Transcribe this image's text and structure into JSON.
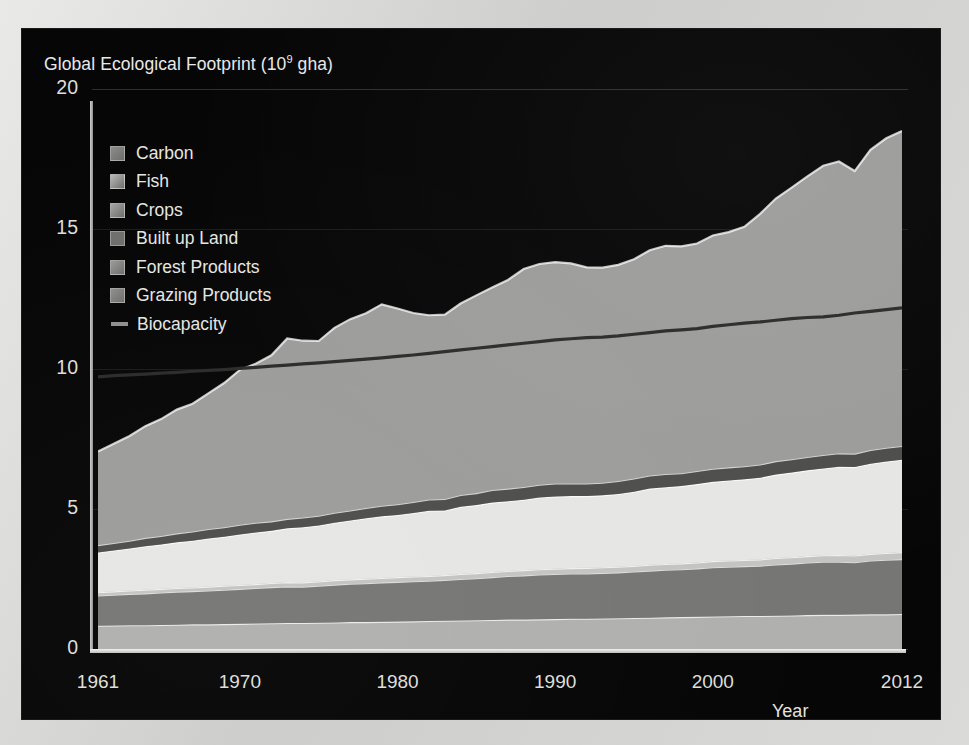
{
  "figure": {
    "title_base": "Global Ecological Footprint (10",
    "title_sup": "9",
    "title_tail": " gha)",
    "background_color": "#060606",
    "text_color": "#e6e6e2"
  },
  "axes": {
    "y_ticks": [
      "0",
      "5",
      "10",
      "15",
      "20"
    ],
    "x_ticks": [
      "1961",
      "1970",
      "1980",
      "1990",
      "2000",
      "2012"
    ],
    "x_title": "Year",
    "y_title": ""
  },
  "legend": {
    "items": [
      {
        "label": "Carbon",
        "color": "#8c8c8a",
        "marker": "square"
      },
      {
        "label": "Fish",
        "color": "#b9b9b7",
        "marker": "square"
      },
      {
        "label": "Crops",
        "color": "#a5a5a3",
        "marker": "square"
      },
      {
        "label": "Built up Land",
        "color": "#6f6f6d",
        "marker": "square"
      },
      {
        "label": "Forest Products",
        "color": "#9a9a98",
        "marker": "square"
      },
      {
        "label": "Grazing Products",
        "color": "#8f8f8d",
        "marker": "square"
      },
      {
        "label": "Biocapacity",
        "color": "#8f8f8d",
        "marker": "line"
      }
    ]
  },
  "chart_data": {
    "type": "area",
    "stacked": true,
    "xlabel": "Year",
    "ylabel": "Global Ecological Footprint (10⁹ gha)",
    "xlim": [
      1961,
      2012
    ],
    "ylim": [
      0,
      20
    ],
    "grid": true,
    "legend_position": "upper-left-inside",
    "x": [
      1961,
      1962,
      1963,
      1964,
      1965,
      1966,
      1967,
      1968,
      1969,
      1970,
      1971,
      1972,
      1973,
      1974,
      1975,
      1976,
      1977,
      1978,
      1979,
      1980,
      1981,
      1982,
      1983,
      1984,
      1985,
      1986,
      1987,
      1988,
      1989,
      1990,
      1991,
      1992,
      1993,
      1994,
      1995,
      1996,
      1997,
      1998,
      1999,
      2000,
      2001,
      2002,
      2003,
      2004,
      2005,
      2006,
      2007,
      2008,
      2009,
      2010,
      2011,
      2012
    ],
    "series": [
      {
        "name": "Grazing Products",
        "color": "#b0b0ae",
        "stack_order": 1,
        "values": [
          0.83,
          0.84,
          0.85,
          0.85,
          0.86,
          0.87,
          0.88,
          0.88,
          0.89,
          0.9,
          0.91,
          0.92,
          0.93,
          0.93,
          0.94,
          0.95,
          0.96,
          0.96,
          0.97,
          0.98,
          0.99,
          1.0,
          1.01,
          1.02,
          1.03,
          1.04,
          1.05,
          1.05,
          1.06,
          1.07,
          1.08,
          1.08,
          1.09,
          1.1,
          1.11,
          1.12,
          1.13,
          1.14,
          1.15,
          1.16,
          1.17,
          1.18,
          1.18,
          1.19,
          1.2,
          1.21,
          1.22,
          1.22,
          1.23,
          1.24,
          1.24,
          1.25
        ]
      },
      {
        "name": "Forest Products",
        "color": "#767674",
        "stack_order": 2,
        "values": [
          1.08,
          1.1,
          1.12,
          1.14,
          1.16,
          1.18,
          1.19,
          1.21,
          1.23,
          1.25,
          1.27,
          1.29,
          1.31,
          1.3,
          1.32,
          1.35,
          1.37,
          1.39,
          1.41,
          1.42,
          1.43,
          1.44,
          1.46,
          1.48,
          1.5,
          1.53,
          1.56,
          1.58,
          1.6,
          1.61,
          1.62,
          1.62,
          1.63,
          1.64,
          1.66,
          1.68,
          1.7,
          1.71,
          1.73,
          1.76,
          1.77,
          1.78,
          1.8,
          1.83,
          1.85,
          1.88,
          1.9,
          1.9,
          1.87,
          1.92,
          1.95,
          1.96
        ]
      },
      {
        "name": "Built up Land",
        "color": "#c4c4c2",
        "stack_order": 3,
        "values": [
          0.12,
          0.12,
          0.12,
          0.13,
          0.13,
          0.13,
          0.13,
          0.14,
          0.14,
          0.14,
          0.14,
          0.15,
          0.15,
          0.15,
          0.15,
          0.16,
          0.16,
          0.16,
          0.16,
          0.17,
          0.17,
          0.17,
          0.17,
          0.18,
          0.18,
          0.18,
          0.18,
          0.19,
          0.19,
          0.19,
          0.19,
          0.2,
          0.2,
          0.2,
          0.2,
          0.21,
          0.21,
          0.21,
          0.21,
          0.22,
          0.22,
          0.22,
          0.22,
          0.23,
          0.23,
          0.23,
          0.23,
          0.24,
          0.24,
          0.24,
          0.24,
          0.25
        ]
      },
      {
        "name": "Crops",
        "color": "#e6e6e4",
        "stack_order": 4,
        "values": [
          1.42,
          1.46,
          1.5,
          1.55,
          1.58,
          1.63,
          1.67,
          1.72,
          1.75,
          1.8,
          1.84,
          1.86,
          1.92,
          1.97,
          2.0,
          2.05,
          2.1,
          2.16,
          2.2,
          2.22,
          2.27,
          2.33,
          2.31,
          2.4,
          2.43,
          2.48,
          2.49,
          2.51,
          2.56,
          2.58,
          2.57,
          2.56,
          2.57,
          2.6,
          2.65,
          2.72,
          2.74,
          2.76,
          2.8,
          2.83,
          2.86,
          2.88,
          2.92,
          2.98,
          3.02,
          3.06,
          3.1,
          3.15,
          3.16,
          3.22,
          3.27,
          3.3
        ]
      },
      {
        "name": "Fish",
        "color": "#4d4d4b",
        "stack_order": 5,
        "values": [
          0.26,
          0.27,
          0.28,
          0.3,
          0.31,
          0.32,
          0.33,
          0.34,
          0.34,
          0.35,
          0.35,
          0.34,
          0.34,
          0.35,
          0.35,
          0.36,
          0.36,
          0.37,
          0.38,
          0.38,
          0.39,
          0.4,
          0.41,
          0.42,
          0.43,
          0.45,
          0.45,
          0.46,
          0.46,
          0.46,
          0.45,
          0.45,
          0.45,
          0.46,
          0.47,
          0.47,
          0.47,
          0.46,
          0.47,
          0.47,
          0.47,
          0.47,
          0.47,
          0.48,
          0.48,
          0.48,
          0.48,
          0.48,
          0.48,
          0.49,
          0.49,
          0.49
        ]
      },
      {
        "name": "Carbon",
        "color": "#9c9c9a",
        "stack_order": 6,
        "values": [
          3.34,
          3.54,
          3.74,
          3.99,
          4.17,
          4.42,
          4.56,
          4.84,
          5.15,
          5.53,
          5.68,
          5.93,
          6.44,
          6.31,
          6.24,
          6.6,
          6.83,
          6.95,
          7.19,
          6.99,
          6.75,
          6.58,
          6.58,
          6.84,
          7.06,
          7.23,
          7.45,
          7.78,
          7.88,
          7.91,
          7.86,
          7.72,
          7.68,
          7.72,
          7.83,
          8.04,
          8.15,
          8.1,
          8.12,
          8.33,
          8.4,
          8.55,
          8.95,
          9.38,
          9.7,
          10.02,
          10.33,
          10.42,
          10.09,
          10.72,
          11.05,
          11.25
        ]
      }
    ],
    "reference_line": {
      "name": "Biocapacity",
      "color": "#2b2b2b",
      "values": [
        9.72,
        9.76,
        9.79,
        9.82,
        9.85,
        9.88,
        9.92,
        9.95,
        9.98,
        10.02,
        10.06,
        10.1,
        10.14,
        10.18,
        10.22,
        10.26,
        10.31,
        10.35,
        10.4,
        10.45,
        10.5,
        10.56,
        10.62,
        10.68,
        10.74,
        10.8,
        10.86,
        10.92,
        10.98,
        11.04,
        11.08,
        11.12,
        11.14,
        11.18,
        11.24,
        11.3,
        11.36,
        11.4,
        11.44,
        11.52,
        11.58,
        11.64,
        11.68,
        11.74,
        11.8,
        11.84,
        11.86,
        11.92,
        12.0,
        12.06,
        12.12,
        12.18
      ]
    }
  }
}
